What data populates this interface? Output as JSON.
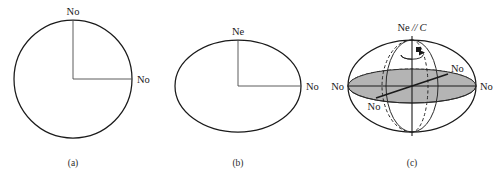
{
  "figure": {
    "background_color": "#ffffff",
    "line_color": "#1a1a1a",
    "shade_color": "#b4b4b4"
  },
  "panels": [
    {
      "id": "a",
      "caption": "(a)",
      "shape": "circle",
      "labels": {
        "top": "No",
        "right": "No"
      }
    },
    {
      "id": "b",
      "caption": "(b)",
      "shape": "ellipse",
      "labels": {
        "top": "Ne",
        "right": "No"
      }
    },
    {
      "id": "c",
      "caption": "(c)",
      "shape": "ellipsoid",
      "labels": {
        "top_prefix": "Ne",
        "top_separator": "//",
        "top_axis": "C",
        "left": "No",
        "right": "No",
        "inner_upper_right": "No",
        "inner_lower_left": "No"
      }
    }
  ]
}
